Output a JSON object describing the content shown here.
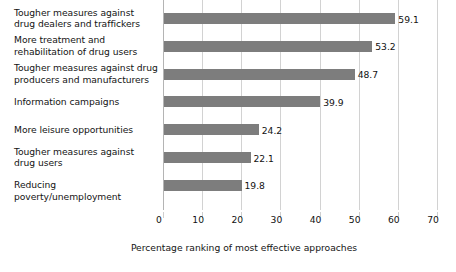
{
  "chart_data": {
    "type": "bar",
    "orientation": "horizontal",
    "title": "",
    "subtitle": "",
    "xlabel": "Percentage ranking of most effective approaches",
    "ylabel": "",
    "xlim": [
      0,
      70
    ],
    "xticks": [
      0,
      10,
      20,
      30,
      40,
      50,
      60,
      70
    ],
    "xtick_labels": [
      "0",
      "10",
      "20",
      "30",
      "40",
      "50",
      "60",
      "70"
    ],
    "grid": "vertical",
    "legend": "none",
    "bar_color": "#7d7d7d",
    "categories": [
      "Tougher measures against drug dealers and traffickers",
      "More treatment and rehabilitation of drug users",
      "Tougher measures against drug producers and manufacturers",
      "Information campaigns",
      "More leisure opportunities",
      "Tougher measures against drug users",
      "Reducing poverty/unemployment"
    ],
    "category_lines": [
      [
        "Tougher measures against",
        "drug dealers and traffickers"
      ],
      [
        "More treatment and",
        "rehabilitation of drug users"
      ],
      [
        "Tougher measures against drug",
        "producers and manufacturers"
      ],
      [
        "Information campaigns"
      ],
      [
        "More leisure opportunities"
      ],
      [
        "Tougher measures against",
        "drug users"
      ],
      [
        "Reducing poverty/unemployment"
      ]
    ],
    "values": [
      59.1,
      53.2,
      48.7,
      39.9,
      24.2,
      22.1,
      19.8
    ],
    "value_labels": [
      "59.1",
      "53.2",
      "48.7",
      "39.9",
      "24.2",
      "22.1",
      "19.8"
    ]
  },
  "colors": {
    "bar": "#7d7d7d",
    "gridline": "#d2d2d2",
    "axis": "#b4b4b4",
    "text": "#111111",
    "background": "#ffffff"
  }
}
